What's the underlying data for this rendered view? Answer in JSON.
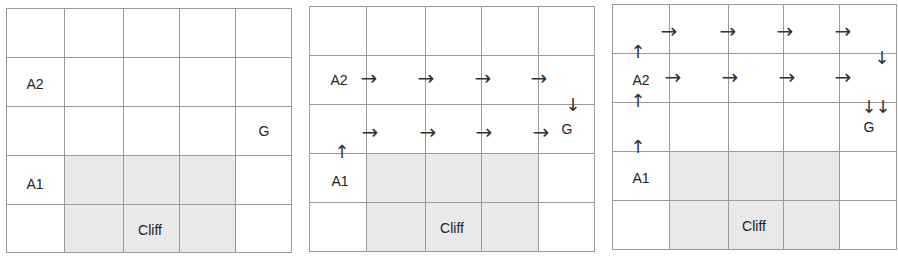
{
  "colors": {
    "grid_line": "#9a9a9a",
    "cliff_fill": "#e9e9e9",
    "text": "#222222",
    "arrow": "#333333"
  },
  "labels": {
    "agent1": "A1",
    "agent2": "A2",
    "goal": "G",
    "cliff": "Cliff"
  },
  "glyphs": {
    "right": "→",
    "up": "↑",
    "down": "↓"
  },
  "panels": [
    {
      "id": "panel-1",
      "caption": "Initial grid: agents A1, A2, goal G, cliff",
      "grid": "5x5"
    },
    {
      "id": "panel-2",
      "caption": "Paths: A2 moves right along row 2; A1 moves up then right along row 3 to G"
    },
    {
      "id": "panel-3",
      "caption": "Paths: A1 moves up to A2; both go up/right along rows 1-2 then down to G"
    }
  ]
}
